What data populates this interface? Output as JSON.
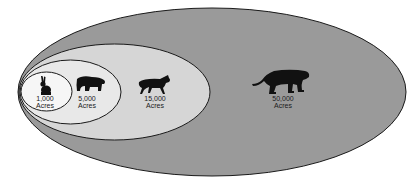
{
  "diagram": {
    "type": "nested-ellipses",
    "colors": {
      "background": "#ffffff",
      "outer_fill": "#9a9a9a",
      "middle_fill": "#d6d6d6",
      "inner_fill": "#e8e8e8",
      "innermost_fill": "#f6f6f6",
      "stroke": "#1a1a1a",
      "silhouette": "#111111"
    },
    "ranges": [
      {
        "animal": "rabbit",
        "icon": "rabbit-icon",
        "value": "1,000",
        "unit": "Acres"
      },
      {
        "animal": "bear",
        "icon": "bear-icon",
        "value": "5,000",
        "unit": "Acres"
      },
      {
        "animal": "wolf",
        "icon": "wolf-icon",
        "value": "15,000",
        "unit": "Acres"
      },
      {
        "animal": "mountain lion",
        "icon": "cougar-icon",
        "value": "50,000",
        "unit": "Acres"
      }
    ]
  }
}
